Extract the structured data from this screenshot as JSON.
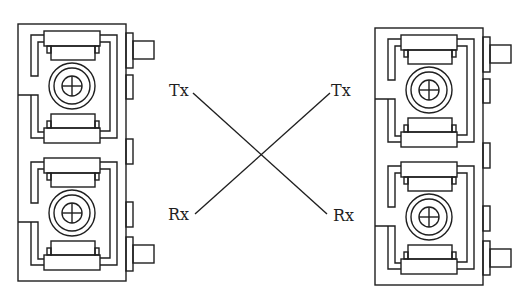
{
  "diagram": {
    "type": "fiber-crossover",
    "left_module": {
      "connectors": [
        "top-port",
        "bottom-port"
      ]
    },
    "right_module": {
      "connectors": [
        "top-port",
        "bottom-port"
      ]
    },
    "labels": {
      "left_tx": "Tx",
      "left_rx": "Rx",
      "right_tx": "Tx",
      "right_rx": "Rx"
    },
    "connections": [
      {
        "from": "left_tx",
        "to": "right_rx"
      },
      {
        "from": "left_rx",
        "to": "right_tx"
      }
    ],
    "colors": {
      "line": "#1f1f1f",
      "background": "#ffffff"
    }
  }
}
